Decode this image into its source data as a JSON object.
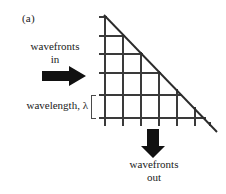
{
  "figure": {
    "panel_label": "(a)",
    "labels": {
      "wavefronts_in": "wavefronts\nin",
      "wavefronts_in_line1": "wavefronts",
      "wavefronts_in_line2": "in",
      "wavefronts_out_line1": "wavefronts",
      "wavefronts_out_line2": "out",
      "wavelength": "wavelength, λ"
    },
    "icons": {
      "input_arrow": "arrow-right-icon",
      "output_arrow": "arrow-down-icon",
      "wavelength_bracket": "bracket-left-icon"
    },
    "colors": {
      "background": "#ffffff",
      "grid_line": "#3a3a3a",
      "diagonal_line": "#2b2b2b",
      "arrow_fill": "#111111",
      "text": "#1a1a1a"
    },
    "geometry": {
      "grid_left_x": 105,
      "grid_bottom_y": 118,
      "diagonal_apex": [
        105,
        16
      ],
      "diagonal_end": [
        216,
        131
      ],
      "horizontal_line_y": [
        17,
        36,
        54,
        73,
        95,
        118
      ],
      "vertical_line_x": [
        105,
        123,
        141,
        159,
        177,
        195,
        213
      ],
      "tick_overhang": 6
    }
  }
}
